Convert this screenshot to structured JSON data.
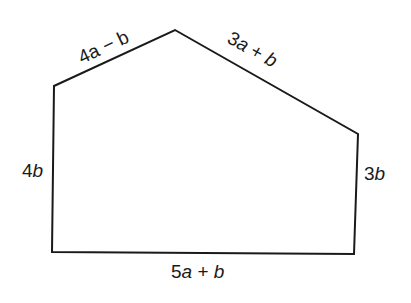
{
  "diagram": {
    "type": "pentagon",
    "stroke_color": "#1a1a1a",
    "background": "#ffffff",
    "vertices": [
      {
        "name": "bottom-left",
        "x": 52,
        "y": 252
      },
      {
        "name": "top-left",
        "x": 54,
        "y": 86
      },
      {
        "name": "apex",
        "x": 175,
        "y": 30
      },
      {
        "name": "top-right",
        "x": 358,
        "y": 134
      },
      {
        "name": "bottom-right",
        "x": 354,
        "y": 254
      }
    ],
    "sides": [
      {
        "id": "left",
        "label": "4b",
        "coef": "4",
        "var": "b"
      },
      {
        "id": "upper-left",
        "label": "4a − b",
        "text": "4a − b"
      },
      {
        "id": "upper-right",
        "label": "3a + b",
        "coef": "3",
        "var1": "a",
        "op": " + ",
        "var2": "b"
      },
      {
        "id": "right",
        "label": "3b",
        "coef": "3",
        "var": "b"
      },
      {
        "id": "bottom",
        "label": "5a + b",
        "coef": "5",
        "var1": "a",
        "op": " + ",
        "var2": "b"
      }
    ]
  }
}
